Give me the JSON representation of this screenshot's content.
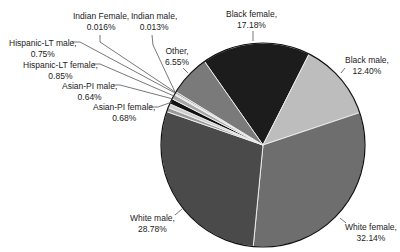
{
  "chart_data": {
    "type": "pie",
    "title": "",
    "start_angle_deg": -125,
    "direction": "clockwise",
    "slices": [
      {
        "label": "Black female",
        "value": 17.18,
        "display": "17.18%",
        "color": "#1c1c1c"
      },
      {
        "label": "Black male",
        "value": 12.4,
        "display": "12.40%",
        "color": "#bdbdbd"
      },
      {
        "label": "White female",
        "value": 32.14,
        "display": "32.14%",
        "color": "#6e6e6e"
      },
      {
        "label": "White male",
        "value": 28.78,
        "display": "28.78%",
        "color": "#4a4a4a"
      },
      {
        "label": "Asian-PI female",
        "value": 0.68,
        "display": "0.68%",
        "color": "#9a9a9a"
      },
      {
        "label": "Asian-PI male",
        "value": 0.64,
        "display": "0.64%",
        "color": "#d0d0d0"
      },
      {
        "label": "Hispanic-LT female",
        "value": 0.85,
        "display": "0.85%",
        "color": "#111111"
      },
      {
        "label": "Hispanic-LT male",
        "value": 0.75,
        "display": "0.75%",
        "color": "#a8a8a8"
      },
      {
        "label": "Indian Female",
        "value": 0.016,
        "display": "0.016%",
        "color": "#e0e0e0"
      },
      {
        "label": "Indian male",
        "value": 0.013,
        "display": "0.013%",
        "color": "#808080"
      },
      {
        "label": "Other",
        "value": 6.55,
        "display": "6.55%",
        "color": "#7a7a7a"
      }
    ],
    "legend": "none (direct labels with leader lines)"
  },
  "labels": {
    "black_female": {
      "name": "Black female,",
      "pct": "17.18%"
    },
    "black_male": {
      "name": "Black male,",
      "pct": "12.40%"
    },
    "white_female": {
      "name": "White female,",
      "pct": "32.14%"
    },
    "white_male": {
      "name": "White male,",
      "pct": "28.78%"
    },
    "asian_pi_female": {
      "name": "Asian-PI female,",
      "pct": "0.68%"
    },
    "asian_pi_male": {
      "name": "Asian-PI male,",
      "pct": "0.64%"
    },
    "hispanic_lt_female": {
      "name": "Hispanic-LT female,",
      "pct": "0.85%"
    },
    "hispanic_lt_male": {
      "name": "Hispanic-LT male,",
      "pct": "0.75%"
    },
    "indian_female": {
      "name": "Indian Female,",
      "pct": "0.016%"
    },
    "indian_male": {
      "name": "Indian male,",
      "pct": "0.013%"
    },
    "other": {
      "name": "Other,",
      "pct": "6.55%"
    }
  }
}
